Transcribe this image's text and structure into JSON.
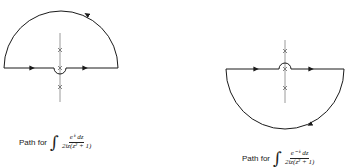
{
  "figures": [
    {
      "id": "upper-contour",
      "caption_prefix": "Path for",
      "integral_symbol": "∫",
      "numerator": "e^{iz} dz",
      "numerator_text": "eⁱᶻ dz",
      "denominator_text": "2iz(z² + 1)",
      "contour": "upper semicircle with small indentation below the origin",
      "direction": "counterclockwise",
      "poles_marked": [
        "i",
        "0",
        "-i"
      ],
      "pole_marker": "×"
    },
    {
      "id": "lower-contour",
      "caption_prefix": "Path for",
      "integral_symbol": "∫",
      "numerator": "e^{-iz} dz",
      "numerator_text": "e⁻ⁱᶻ dz",
      "denominator_text": "2iz(z² + 1)",
      "contour": "lower semicircle with small indentation above the origin",
      "direction": "clockwise",
      "poles_marked": [
        "i",
        "0",
        "-i"
      ],
      "pole_marker": "×"
    }
  ],
  "colors": {
    "contour": "#1a1a1a",
    "axis": "#9a9a9a",
    "marker": "#666666"
  }
}
